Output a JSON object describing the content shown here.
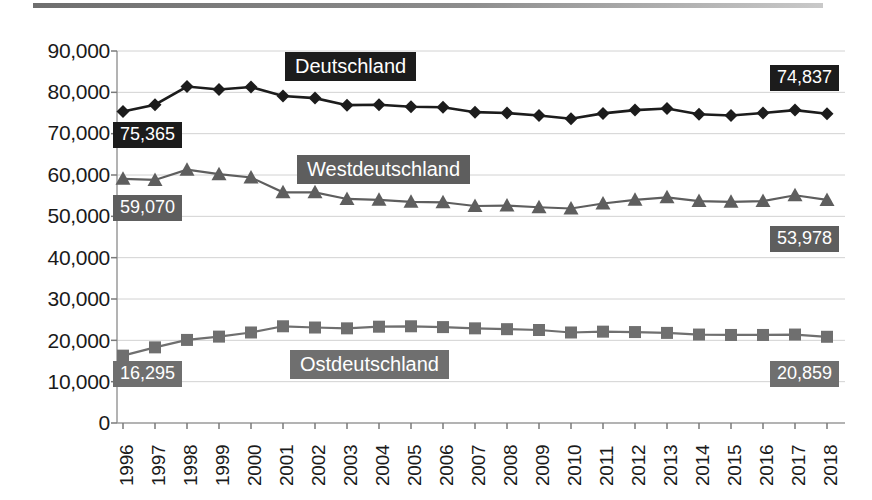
{
  "chart_data": {
    "type": "line",
    "title": "",
    "xlabel": "",
    "ylabel": "",
    "grid": true,
    "legend_position": "inline-callouts",
    "ylim": [
      0,
      90000
    ],
    "yticks": [
      "0",
      "10,000",
      "20,000",
      "30,000",
      "40,000",
      "50,000",
      "60,000",
      "70,000",
      "80,000",
      "90,000"
    ],
    "ytick_values": [
      0,
      10000,
      20000,
      30000,
      40000,
      50000,
      60000,
      70000,
      80000,
      90000
    ],
    "categories": [
      "1996",
      "1997",
      "1998",
      "1999",
      "2000",
      "2001",
      "2002",
      "2003",
      "2004",
      "2005",
      "2006",
      "2007",
      "2008",
      "2009",
      "2010",
      "2011",
      "2012",
      "2013",
      "2014",
      "2015",
      "2016",
      "2017",
      "2018"
    ],
    "series": [
      {
        "name": "Deutschland",
        "marker": "diamond",
        "color": "#1c1c1c",
        "values": [
          75365,
          77000,
          81400,
          80700,
          81300,
          79100,
          78600,
          76900,
          77000,
          76500,
          76400,
          75200,
          75000,
          74400,
          73600,
          74900,
          75700,
          76100,
          74700,
          74400,
          75000,
          75700,
          74837
        ],
        "start_label": "75,365",
        "end_label": "74,837"
      },
      {
        "name": "Westdeutschland",
        "marker": "triangle",
        "color": "#5e5e5e",
        "values": [
          59070,
          58800,
          61300,
          60200,
          59400,
          55800,
          55800,
          54200,
          54000,
          53500,
          53400,
          52500,
          52600,
          52200,
          51900,
          53100,
          54000,
          54600,
          53700,
          53500,
          53700,
          55100,
          53978
        ],
        "start_label": "59,070",
        "end_label": "53,978"
      },
      {
        "name": "Ostdeutschland",
        "marker": "square",
        "color": "#6f6f6f",
        "values": [
          16295,
          18300,
          20100,
          20900,
          21900,
          23400,
          23100,
          22900,
          23300,
          23400,
          23200,
          22900,
          22700,
          22500,
          21900,
          22100,
          22000,
          21800,
          21400,
          21300,
          21300,
          21400,
          20859
        ],
        "start_label": "16,295",
        "end_label": "20,859"
      }
    ]
  },
  "labels": {
    "deutschland": "Deutschland",
    "westdeutschland": "Westdeutschland",
    "ostdeutschland": "Ostdeutschland",
    "de_start": "75,365",
    "de_end": "74,837",
    "west_start": "59,070",
    "west_end": "53,978",
    "ost_start": "16,295",
    "ost_end": "20,859"
  },
  "yticks": {
    "t0": "0",
    "t1": "10,000",
    "t2": "20,000",
    "t3": "30,000",
    "t4": "40,000",
    "t5": "50,000",
    "t6": "60,000",
    "t7": "70,000",
    "t8": "80,000",
    "t9": "90,000"
  },
  "xticks": {
    "y0": "1996",
    "y1": "1997",
    "y2": "1998",
    "y3": "1999",
    "y4": "2000",
    "y5": "2001",
    "y6": "2002",
    "y7": "2003",
    "y8": "2004",
    "y9": "2005",
    "y10": "2006",
    "y11": "2007",
    "y12": "2008",
    "y13": "2009",
    "y14": "2010",
    "y15": "2011",
    "y16": "2012",
    "y17": "2013",
    "y18": "2014",
    "y19": "2015",
    "y20": "2016",
    "y21": "2017",
    "y22": "2018"
  },
  "colors": {
    "deutschland": "#1c1c1c",
    "westdeutschland": "#5e5e5e",
    "ostdeutschland": "#6f6f6f",
    "grid": "#d2d2d2",
    "axis": "#8a8a8a"
  }
}
